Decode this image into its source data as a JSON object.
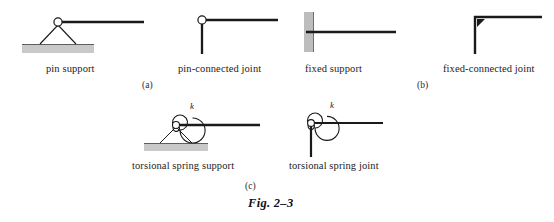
{
  "figure": {
    "number_label": "Fig. 2–3",
    "rows": [
      {
        "id": "a",
        "row_label": "(a)",
        "items": [
          {
            "name": "pin-support",
            "caption": "pin support"
          },
          {
            "name": "pin-connected-joint",
            "caption": "pin-connected joint"
          }
        ]
      },
      {
        "id": "b",
        "row_label": "(b)",
        "items": [
          {
            "name": "fixed-support",
            "caption": "fixed support"
          },
          {
            "name": "fixed-connected-joint",
            "caption": "fixed-connected joint"
          }
        ]
      },
      {
        "id": "c",
        "row_label": "(c)",
        "items": [
          {
            "name": "torsional-spring-support",
            "caption": "torsional spring support",
            "spring_constant_label": "k"
          },
          {
            "name": "torsional-spring-joint",
            "caption": "torsional spring joint",
            "spring_constant_label": "k"
          }
        ]
      }
    ]
  },
  "colors": {
    "ink": "#1a1a1a",
    "ground_fill": "#c9c9c9",
    "ground_edge": "#6f6f6f",
    "wall_fill": "#bdbdbd",
    "wall_edge": "#7a7a7a",
    "background": "#ffffff"
  }
}
